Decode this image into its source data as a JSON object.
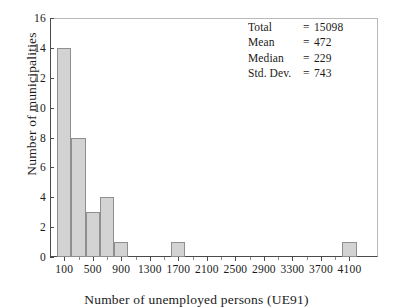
{
  "chart_data": {
    "type": "bar",
    "title": "",
    "xlabel": "Number of unemployed persons (UE91)",
    "ylabel": "Number of municipalities",
    "xlim": [
      -100,
      4500
    ],
    "ylim": [
      0,
      16
    ],
    "grid": false,
    "legend": "none",
    "bin_width": 200,
    "x_tick_labels": [
      "100",
      "500",
      "900",
      "1300",
      "1700",
      "2100",
      "2500",
      "2900",
      "3300",
      "3700",
      "4100"
    ],
    "x_tick_values": [
      100,
      500,
      900,
      1300,
      1700,
      2100,
      2500,
      2900,
      3300,
      3700,
      4100
    ],
    "y_tick_labels": [
      "0",
      "2",
      "4",
      "6",
      "8",
      "10",
      "12",
      "14",
      "16"
    ],
    "y_tick_values": [
      0,
      2,
      4,
      6,
      8,
      10,
      12,
      14,
      16
    ],
    "bins": [
      {
        "left": 0,
        "right": 200,
        "center": 100,
        "value": 14
      },
      {
        "left": 200,
        "right": 400,
        "center": 300,
        "value": 8
      },
      {
        "left": 400,
        "right": 600,
        "center": 500,
        "value": 3
      },
      {
        "left": 600,
        "right": 800,
        "center": 700,
        "value": 4
      },
      {
        "left": 800,
        "right": 1000,
        "center": 900,
        "value": 1
      },
      {
        "left": 1600,
        "right": 1800,
        "center": 1700,
        "value": 1
      },
      {
        "left": 4000,
        "right": 4200,
        "center": 4100,
        "value": 1
      }
    ],
    "categories": [
      100,
      300,
      500,
      700,
      900,
      1700,
      4100
    ],
    "values": [
      14,
      8,
      3,
      4,
      1,
      1,
      1
    ],
    "annotations": {
      "total_label": "Total",
      "total_value": "15098",
      "mean_label": "Mean",
      "mean_value": "472",
      "median_label": "Median",
      "median_value": "229",
      "stddev_label": "Std. Dev.",
      "stddev_value": "743",
      "equals": "="
    },
    "colors": {
      "bar_fill": "#d3d3d3",
      "bar_edge": "#8f8f8f",
      "axis": "#4a4a4a",
      "text": "#1a1a1a",
      "background": "#ffffff"
    }
  }
}
